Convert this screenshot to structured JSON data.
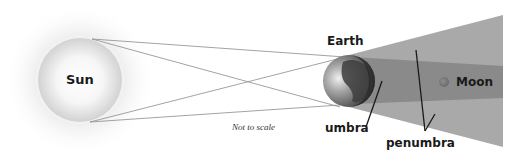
{
  "diagram": {
    "labels": {
      "sun": "Sun",
      "earth": "Earth",
      "moon": "Moon",
      "umbra": "umbra",
      "penumbra": "penumbra",
      "note": "Not to scale"
    },
    "colors": {
      "background": "#ffffff",
      "sun_core": "#ffffff",
      "sun_edge": "#d4d4d4",
      "sun_glow": "#eeeeee",
      "penumbra": "#a9a9a9",
      "umbra": "#8a8a8a",
      "moon": "#777777",
      "earth_land": "#3d3d3d",
      "earth_ocean": "#9a9a9a",
      "rays": "#8c8c8c",
      "text": "#1a1a1a"
    }
  }
}
